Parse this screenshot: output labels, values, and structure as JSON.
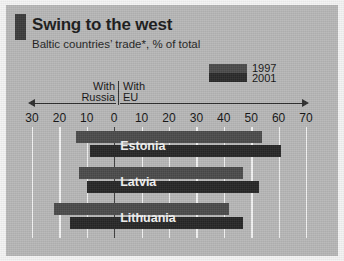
{
  "header": {
    "title": "Swing to the west",
    "subtitle": "Baltic countries’ trade*, % of total",
    "accent_color": "#3b3b3b"
  },
  "legend": {
    "items": [
      {
        "label": "1997",
        "color": "#4a4a4a"
      },
      {
        "label": "2001",
        "color": "#2a2a2a"
      }
    ]
  },
  "axis_direction": {
    "left_line1": "With",
    "left_line2": "Russia",
    "right_line1": "With",
    "right_line2": "EU",
    "left_arrow_icon": "arrow-left-icon",
    "right_arrow_icon": "arrow-right-icon"
  },
  "chart_data": {
    "type": "bar",
    "orientation": "horizontal",
    "title": "Swing to the west",
    "subtitle": "Baltic countries’ trade*, % of total",
    "xlabel": "",
    "ylabel": "",
    "xlim": [
      -30,
      70
    ],
    "grid": true,
    "legend_position": "top-right",
    "tick_labels": [
      "30",
      "20",
      "10",
      "0",
      "10",
      "20",
      "30",
      "40",
      "50",
      "60",
      "70"
    ],
    "tick_values": [
      -30,
      -20,
      -10,
      0,
      10,
      20,
      30,
      40,
      50,
      60,
      70
    ],
    "categories": [
      "Estonia",
      "Latvia",
      "Lithuania"
    ],
    "series": [
      {
        "name": "1997",
        "russia_values": [
          -14,
          -13,
          -22
        ],
        "eu_values": [
          54,
          47,
          42
        ]
      },
      {
        "name": "2001",
        "russia_values": [
          -9,
          -10,
          -16
        ],
        "eu_values": [
          61,
          53,
          47
        ]
      }
    ],
    "footnote": ""
  }
}
